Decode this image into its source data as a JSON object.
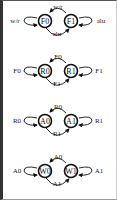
{
  "diagram": {
    "title": "",
    "machines": [
      {
        "id": "fsm-1",
        "nodes": [
          "F0",
          "F1"
        ],
        "edges": {
          "top": "w/r",
          "bottom": "alu",
          "left_loop": "w/r",
          "right_loop": "alu"
        }
      },
      {
        "id": "fsm-2",
        "nodes": [
          "R0",
          "R1"
        ],
        "edges": {
          "top": "F0",
          "bottom": "F1",
          "left_loop": "F0",
          "right_loop": "F1"
        }
      },
      {
        "id": "fsm-3",
        "nodes": [
          "A0",
          "A1"
        ],
        "edges": {
          "top": "R0",
          "bottom": "R1",
          "left_loop": "R0",
          "right_loop": "R1"
        }
      },
      {
        "id": "fsm-4",
        "nodes": [
          "W0",
          "W1"
        ],
        "edges": {
          "top": "A0",
          "bottom": "A1",
          "left_loop": "A0",
          "right_loop": "A1"
        }
      }
    ]
  }
}
